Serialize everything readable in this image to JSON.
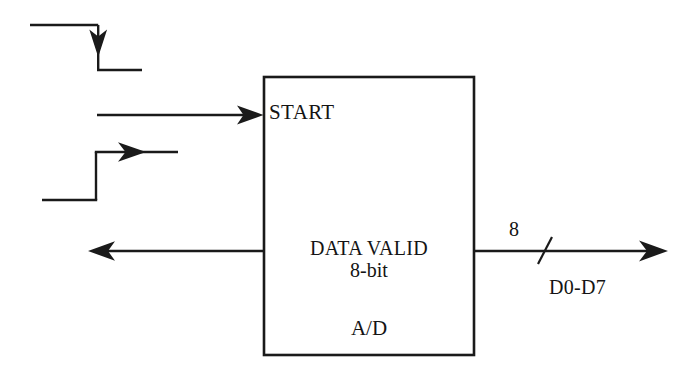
{
  "diagram": {
    "background_color": "#ffffff",
    "line_color": "#1a1a1a",
    "text_color": "#141414",
    "block": {
      "name": "a-d-converter-block",
      "labels": {
        "start": "START",
        "data_valid": "DATA VALID",
        "bit_width": "8-bit",
        "device": "A/D"
      },
      "geometry": {
        "x": 264,
        "y": 77,
        "width": 210,
        "height": 278
      }
    },
    "signals": [
      {
        "name": "start-falling-edge-waveform",
        "kind": "waveform",
        "edge": "falling",
        "label": "",
        "description": "high level then falling transition with downward arrow then low level"
      },
      {
        "name": "start-input-arrow",
        "kind": "arrow",
        "direction": "right",
        "target": "START",
        "label": ""
      },
      {
        "name": "data-valid-rising-edge-waveform",
        "kind": "waveform",
        "edge": "rising",
        "label": "",
        "description": "low level then rising transition then high level with rightward arrow"
      },
      {
        "name": "data-valid-output-arrow",
        "kind": "arrow",
        "direction": "left",
        "source": "DATA VALID",
        "label": ""
      },
      {
        "name": "data-bus-output",
        "kind": "bus",
        "direction": "right",
        "width_label": "8",
        "bus_label": "D0-D7",
        "slash_tick": true
      }
    ],
    "bus": {
      "width_label": "8",
      "name_label": "D0-D7"
    }
  }
}
